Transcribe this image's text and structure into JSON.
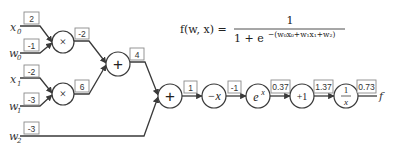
{
  "formula": {
    "lhs": "f(w, x) =",
    "numerator": "1",
    "denominator_prefix": "1 + e",
    "exponent": "−(w₀x₀+w₁x₁+w₂)"
  },
  "inputs": [
    {
      "label": "x",
      "subscript": "0",
      "value": "2"
    },
    {
      "label": "w",
      "subscript": "0",
      "value": "-1"
    },
    {
      "label": "x",
      "subscript": "1",
      "value": "-2"
    },
    {
      "label": "w",
      "subscript": "1",
      "value": "-3"
    },
    {
      "label": "w",
      "subscript": "2",
      "value": "-3"
    }
  ],
  "nodes": [
    {
      "id": "mul0",
      "op": "×",
      "output": "-2"
    },
    {
      "id": "mul1",
      "op": "×",
      "output": "6"
    },
    {
      "id": "add0",
      "op": "+",
      "output": "4"
    },
    {
      "id": "add1",
      "op": "+",
      "output": "1"
    },
    {
      "id": "neg",
      "op": "−x",
      "output": "-1"
    },
    {
      "id": "exp",
      "op": "e",
      "op_sup": "x",
      "output": "0.37"
    },
    {
      "id": "plus1",
      "op": "+1",
      "output": "1.37"
    },
    {
      "id": "recip",
      "op_num": "1",
      "op_den": "x",
      "output": "0.73"
    }
  ],
  "output_label": "f"
}
